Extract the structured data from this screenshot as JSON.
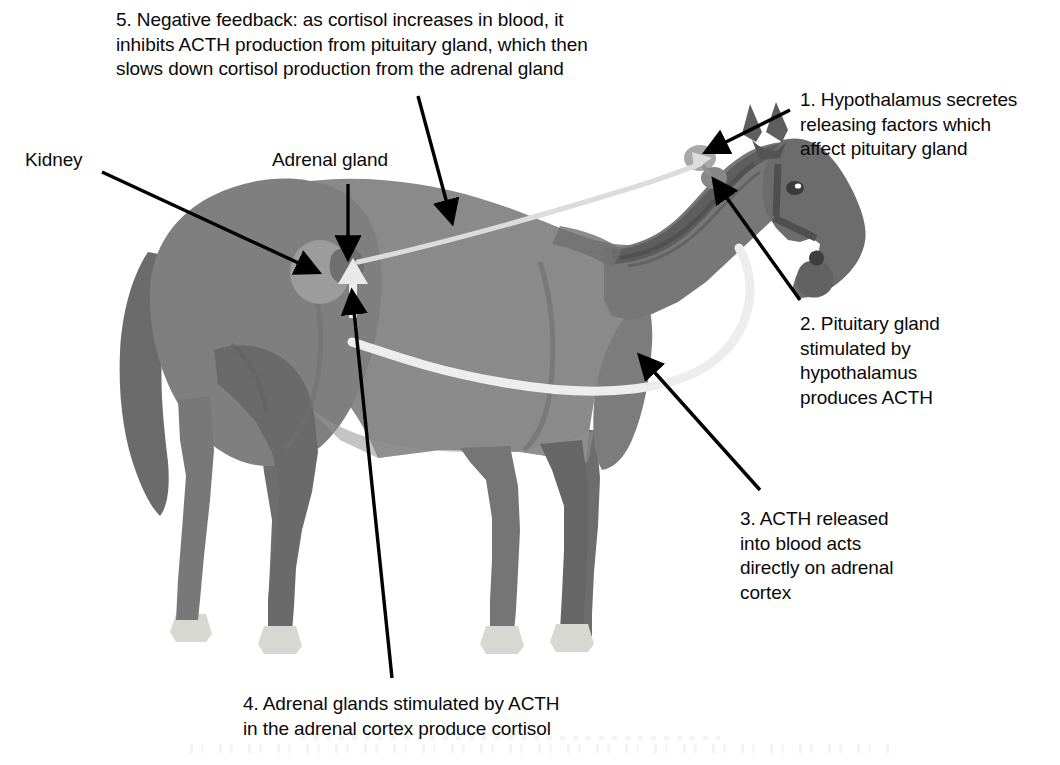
{
  "diagram": {
    "background_color": "#ffffff",
    "text_color": "#0a0a0a"
  },
  "labels": {
    "step5": "5.  Negative feedback: as cortisol increases in blood, it\ninhibits ACTH production from pituitary gland, which then\nslows down cortisol production from the adrenal gland",
    "step1": "1. Hypothalamus secretes\nreleasing factors which\naffect pituitary gland",
    "step2": "2. Pituitary gland\nstimulated by\nhypothalamus\nproduces ACTH",
    "step3": "3. ACTH released\ninto blood acts\ndirectly on adrenal\ncortex",
    "step4": "4. Adrenal glands stimulated by ACTH\nin the adrenal cortex produce cortisol",
    "kidney": "Kidney",
    "adrenal_gland": "Adrenal gland"
  },
  "anatomy": {
    "horse_body_color": "#8a8a8a",
    "horse_shadow_color": "#6f6f6f",
    "horse_dark_color": "#5d5d5d",
    "mane_color": "#646464",
    "hoof_color": "#d8d8d2",
    "kidney_color": "#9b9b9b",
    "adrenal_color": "#6a6a6a",
    "hypothalamus_color": "#a6a6a6",
    "pituitary_color": "#767676",
    "parts": [
      {
        "name": "kidney",
        "label": "Kidney"
      },
      {
        "name": "adrenal-gland",
        "label": "Adrenal gland"
      },
      {
        "name": "hypothalamus",
        "label": "Hypothalamus"
      },
      {
        "name": "pituitary-gland",
        "label": "Pituitary gland"
      }
    ]
  },
  "pathways": {
    "acth_blood_color": "#ededed",
    "feedback_color": "#dcdcdc",
    "pointer_color": "#000000",
    "flows": [
      {
        "name": "acth-to-adrenal",
        "from": "pituitary gland",
        "to": "adrenal cortex",
        "carrier": "blood"
      },
      {
        "name": "cortisol-negative-feedback",
        "from": "adrenal gland",
        "to": "pituitary gland",
        "carrier": "blood"
      }
    ]
  },
  "pointers": [
    {
      "name": "pointer-step5-to-back",
      "target": "horse back / trunk"
    },
    {
      "name": "pointer-step1-to-hypothalamus",
      "target": "hypothalamus"
    },
    {
      "name": "pointer-step2-to-pituitary",
      "target": "pituitary gland"
    },
    {
      "name": "pointer-step3-to-blood",
      "target": "blood vessel along belly"
    },
    {
      "name": "pointer-step4-to-adrenal-cortex",
      "target": "adrenal cortex"
    },
    {
      "name": "pointer-kidney",
      "target": "kidney"
    },
    {
      "name": "pointer-adrenal-gland",
      "target": "adrenal gland"
    }
  ]
}
